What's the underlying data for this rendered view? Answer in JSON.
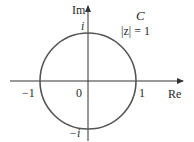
{
  "diagram": {
    "axes": {
      "horizontal_label": "Re",
      "vertical_label": "Im"
    },
    "curve": {
      "name": "C",
      "equation": "|z| = 1"
    },
    "tick_labels": {
      "origin": "0",
      "pos_real": "1",
      "neg_real": "−1",
      "pos_imag": "i",
      "neg_imag": "−i"
    },
    "colors": {
      "circle": "#555555",
      "axes": "#333333",
      "text": "#2a2a2a"
    }
  }
}
